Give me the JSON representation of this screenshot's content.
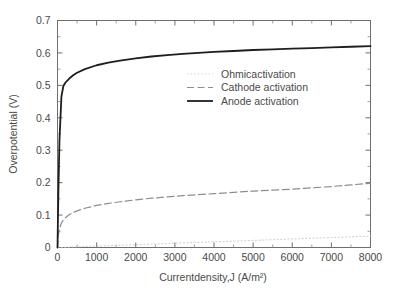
{
  "chart_data": {
    "type": "line",
    "title": "",
    "xlabel": "Currentdensity,J (A/m²)",
    "ylabel": "Overpotential (V)",
    "xlim": [
      0,
      8000
    ],
    "ylim": [
      0,
      0.7
    ],
    "grid": false,
    "legend_position": "center",
    "x_ticks": [
      0,
      1000,
      2000,
      3000,
      4000,
      5000,
      6000,
      7000,
      8000
    ],
    "x_tick_labels": [
      "0",
      "1000",
      "2000",
      "3000",
      "4000",
      "5000",
      "6000",
      "7000",
      "8000"
    ],
    "x_minor_interval": 500,
    "y_ticks": [
      0,
      0.1,
      0.2,
      0.3,
      0.4,
      0.5,
      0.6,
      0.7
    ],
    "y_tick_labels": [
      "0",
      "0.1",
      "0.2",
      "0.3",
      "0.4",
      "0.5",
      "0.6",
      "0.7"
    ],
    "y_minor_interval": 0.05,
    "x": [
      0,
      20,
      50,
      100,
      150,
      200,
      300,
      400,
      500,
      700,
      1000,
      1300,
      1600,
      2000,
      2400,
      2800,
      3200,
      3600,
      4000,
      4500,
      5000,
      5500,
      6000,
      6500,
      7000,
      7500,
      8000
    ],
    "series": [
      {
        "name": "Ohmicactivation",
        "label": "Ohmicactivation",
        "style": "dotted",
        "color": "#cfcfcf",
        "width": 1.0,
        "values": [
          0.0,
          0.0001,
          0.0002,
          0.0004,
          0.0007,
          0.0009,
          0.0013,
          0.0018,
          0.0022,
          0.0031,
          0.0044,
          0.0057,
          0.007,
          0.0088,
          0.0105,
          0.0123,
          0.014,
          0.0158,
          0.0175,
          0.0197,
          0.0219,
          0.0241,
          0.0263,
          0.0285,
          0.0307,
          0.0329,
          0.035
        ]
      },
      {
        "name": "Cathode activation",
        "label": "Cathode activation",
        "style": "dashed",
        "color": "#8e8e8e",
        "width": 1.2,
        "values": [
          0.0,
          0.037,
          0.058,
          0.075,
          0.085,
          0.092,
          0.101,
          0.108,
          0.113,
          0.121,
          0.13,
          0.136,
          0.141,
          0.147,
          0.152,
          0.156,
          0.16,
          0.163,
          0.166,
          0.17,
          0.174,
          0.177,
          0.18,
          0.184,
          0.188,
          0.193,
          0.198
        ]
      },
      {
        "name": "Anode activation",
        "label": "Anode activation",
        "style": "solid",
        "color": "#1e1e1e",
        "width": 1.8,
        "values": [
          0.0,
          0.155,
          0.33,
          0.465,
          0.498,
          0.508,
          0.521,
          0.531,
          0.539,
          0.55,
          0.562,
          0.57,
          0.576,
          0.583,
          0.589,
          0.593,
          0.597,
          0.6,
          0.603,
          0.606,
          0.609,
          0.611,
          0.613,
          0.615,
          0.617,
          0.619,
          0.621
        ]
      }
    ]
  }
}
